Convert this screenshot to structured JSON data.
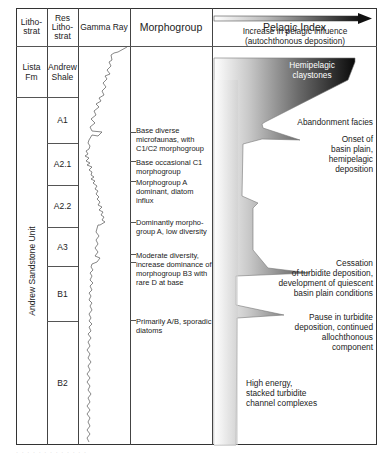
{
  "headers": {
    "lithostrat": "Litho-\nstrat",
    "res_lithostrat": "Res\nLitho-\nstrat",
    "gamma_ray": "Gamma Ray",
    "morphogroup": "Morphogroup",
    "pelagic_index": "Pelagic Index"
  },
  "lithostrat": [
    {
      "label": "Lista\nFm",
      "top": 46,
      "bottom": 97
    },
    {
      "label": "Andrew Sandstone Unit",
      "top": 97,
      "bottom": 445,
      "vertical": true
    }
  ],
  "res_lithostrat": [
    {
      "label": "Andrew\nShale",
      "top": 46,
      "bottom": 97
    },
    {
      "label": "A1",
      "top": 97,
      "bottom": 143
    },
    {
      "label": "A2.1",
      "top": 143,
      "bottom": 185
    },
    {
      "label": "A2.2",
      "top": 185,
      "bottom": 227
    },
    {
      "label": "A3",
      "top": 227,
      "bottom": 266
    },
    {
      "label": "B1",
      "top": 266,
      "bottom": 321
    },
    {
      "label": "B2",
      "top": 321,
      "bottom": 445
    }
  ],
  "morphogroup_notes": [
    {
      "text": "Base diverse microfaunas, with C1/C2 morphogroup",
      "y": 126
    },
    {
      "text": "Base occasional C1 morphogroup",
      "y": 159
    },
    {
      "text": "Morphogroup A dominant, diatom influx",
      "y": 179
    },
    {
      "text": "Dominantly morpho-group A, low diversity",
      "y": 219
    },
    {
      "text": "Moderate diversity, increase dominance of morphogroup B3 with rare D at base",
      "y": 252
    },
    {
      "text": "Primarily A/B, sporadic diatoms",
      "y": 318
    }
  ],
  "pelagic_index": {
    "arrow_label": "Increase in pelagic influence\n(autochthonous deposition)",
    "annotations": [
      {
        "text": "Hemipelagic\nclaystones",
        "style": "inverse"
      },
      {
        "text": "Abandonment facies"
      },
      {
        "text": "Onset of\nbasin plain,\nhemipelagic\ndeposition"
      },
      {
        "text": "Cessation\nof turbidite deposition,\ndevelopment of quiescent\nbasin plain conditions"
      },
      {
        "text": "Pause in turbidite\ndeposition, continued\nallochthonous\ncomponent"
      },
      {
        "text": "High energy,\nstacked turbidite\nchannel complexes",
        "align": "left"
      }
    ]
  },
  "colors": {
    "line": "#333333",
    "curve": "#555555",
    "fill_dark": "#111111",
    "fill_light": "#ffffff"
  },
  "caption": "· · · · · · · · · · · · ·"
}
